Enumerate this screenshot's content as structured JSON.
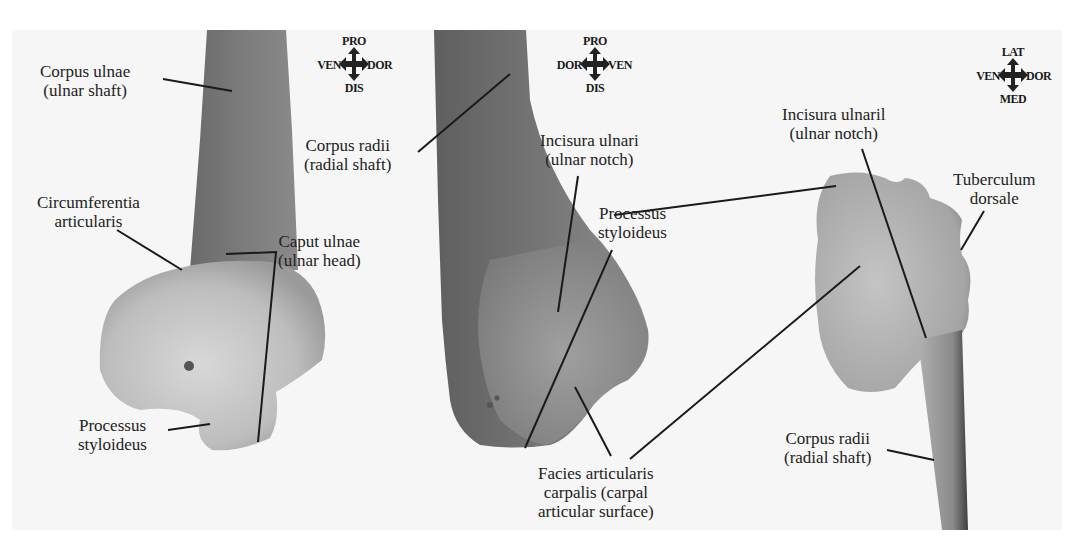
{
  "figure": {
    "background": "#f6f6f6",
    "panels": [
      {
        "id": "ulna-distal",
        "compass": {
          "top": "PRO",
          "left": "VEN",
          "right": "DOR",
          "bottom": "DIS"
        },
        "labels": [
          {
            "line1": "Corpus ulnae",
            "line2": "(ulnar shaft)"
          },
          {
            "line1": "Circumferentia",
            "line2": "articularis"
          },
          {
            "line1": "Caput ulnae",
            "line2": "(ulnar head)"
          },
          {
            "line1": "Processus",
            "line2": "styloideus"
          }
        ]
      },
      {
        "id": "radius-distal",
        "compass": {
          "top": "PRO",
          "left": "DOR",
          "right": "VEN",
          "bottom": "DIS"
        },
        "labels": [
          {
            "line1": "Corpus radii",
            "line2": "(radial shaft)"
          },
          {
            "line1": "Incisura ulnari",
            "line2": "(ulnar notch)"
          },
          {
            "line1": "Processus",
            "line2": "styloideus"
          },
          {
            "line1": "Facies articularis",
            "line2": "carpalis (carpal",
            "line3": "articular surface)"
          }
        ]
      },
      {
        "id": "radius-distal-end-view",
        "compass": {
          "top": "LAT",
          "left": "VEN",
          "right": "DOR",
          "bottom": "MED"
        },
        "labels": [
          {
            "line1": "Incisura ulnaril",
            "line2": "(ulnar notch)"
          },
          {
            "line1": "Tuberculum",
            "line2": "dorsale"
          },
          {
            "line1": "Corpus radii",
            "line2": "(radial shaft)"
          }
        ]
      }
    ]
  }
}
